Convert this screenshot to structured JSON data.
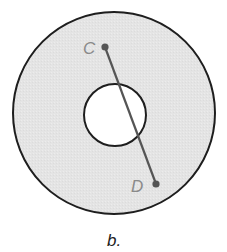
{
  "figure": {
    "caption": "b.",
    "colors": {
      "annulus_fill": "#e6e6e6",
      "outline": "#1e1e1e",
      "segment": "#555555",
      "point": "#555555",
      "inner_fill": "#ffffff"
    },
    "outer_circle": {
      "cx": 114,
      "cy": 113,
      "r": 101
    },
    "inner_circle": {
      "cx": 115,
      "cy": 115,
      "r": 31
    },
    "segment": {
      "start": {
        "label": "C",
        "x": 105,
        "y": 47
      },
      "end": {
        "label": "D",
        "x": 156,
        "y": 184
      }
    }
  }
}
